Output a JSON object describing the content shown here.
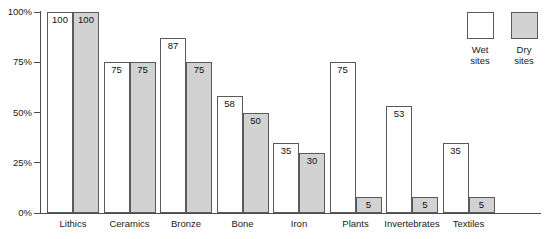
{
  "chart_data": {
    "type": "bar",
    "title": "",
    "xlabel": "",
    "ylabel": "",
    "ylim": [
      0,
      100
    ],
    "ytick_labels": [
      "0%",
      "25%",
      "50%",
      "75%",
      "100%"
    ],
    "ytick_values": [
      0,
      25,
      50,
      75,
      100
    ],
    "grid": false,
    "legend_position": "top-right",
    "categories": [
      "Lithics",
      "Ceramics",
      "Bronze",
      "Bone",
      "Iron",
      "Plants",
      "Invertebrates",
      "Textiles"
    ],
    "series": [
      {
        "name": "Wet sites",
        "color": "#ffffff",
        "values": [
          100,
          75,
          87,
          58,
          35,
          75,
          53,
          35
        ]
      },
      {
        "name": "Dry sites",
        "color": "#d2d2d2",
        "values": [
          100,
          75,
          75,
          50,
          30,
          5,
          5,
          5
        ]
      }
    ]
  },
  "legend": {
    "entries": [
      {
        "swatch": "wet",
        "line1": "Wet",
        "line2": "sites"
      },
      {
        "swatch": "dry",
        "line1": "Dry",
        "line2": "sites"
      }
    ]
  },
  "title_remnant": ""
}
